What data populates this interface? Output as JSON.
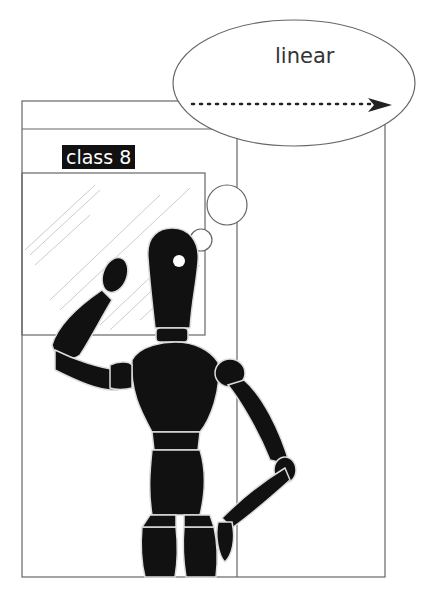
{
  "thought_bubble": {
    "text": "linear",
    "arrow": "dotted-arrow-right"
  },
  "sign": {
    "label": "class 8"
  },
  "colors": {
    "line": "#666666",
    "figure": "#111111",
    "glass": "#cccccc",
    "label_bg": "#111111",
    "label_text": "#ffffff"
  }
}
